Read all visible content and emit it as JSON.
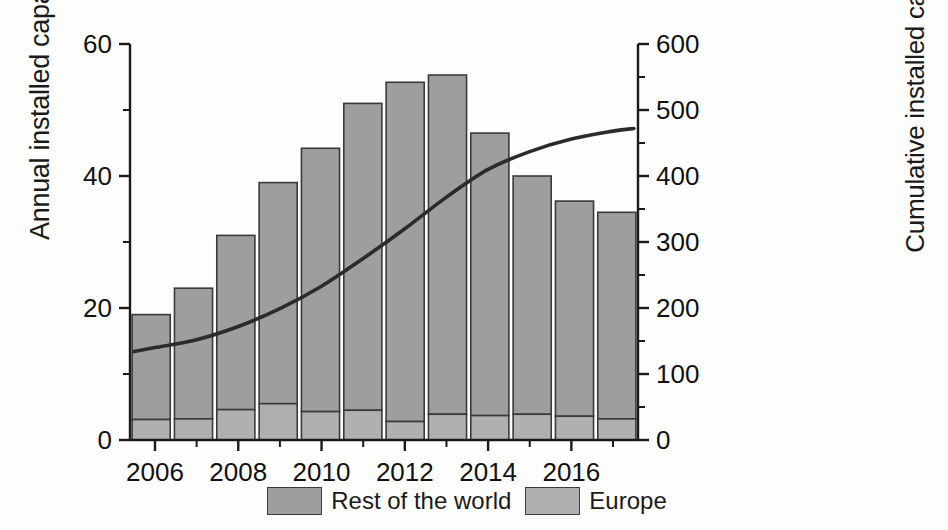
{
  "chart_data": {
    "type": "bar",
    "title": "",
    "subtitle": "",
    "categories": [
      2006,
      2007,
      2008,
      2009,
      2010,
      2011,
      2012,
      2013,
      2014,
      2015,
      2016,
      2017
    ],
    "xlabel": "",
    "xtick_labels": [
      "2006",
      "2008",
      "2010",
      "2012",
      "2014",
      "2016"
    ],
    "xtick_values": [
      2006,
      2008,
      2010,
      2012,
      2014,
      2016
    ],
    "xminor_values": [
      2007,
      2009,
      2011,
      2013,
      2015,
      2017
    ],
    "xlim": [
      2005.4,
      2017.6
    ],
    "grid": false,
    "legend_position": "bottom",
    "series": [
      {
        "name": "Europe",
        "axis": "left",
        "type": "bar",
        "stacked": true,
        "color": "#b0b0b0",
        "values": [
          3.1,
          3.2,
          4.6,
          5.5,
          4.3,
          4.5,
          2.8,
          3.9,
          3.7,
          3.9,
          3.6,
          3.2
        ]
      },
      {
        "name": "Rest of the world",
        "axis": "left",
        "type": "bar",
        "stacked": true,
        "color": "#9e9e9e",
        "values": [
          15.9,
          19.8,
          26.4,
          33.5,
          39.9,
          46.5,
          51.4,
          51.4,
          42.8,
          36.1,
          32.6,
          31.3
        ]
      },
      {
        "name": "Cumulative installed capacity",
        "axis": "right",
        "type": "line",
        "color": "#2b2b2b",
        "x": [
          2005.5,
          2006,
          2007,
          2008,
          2009,
          2010,
          2011,
          2012,
          2013,
          2014,
          2015,
          2016,
          2017,
          2017.5
        ],
        "values": [
          134,
          140,
          152,
          172,
          199,
          233,
          275,
          320,
          368,
          410,
          437,
          456,
          468,
          472
        ]
      }
    ],
    "bar_totals": [
      19.0,
      23.0,
      31.0,
      39.0,
      44.2,
      51.0,
      54.2,
      55.3,
      46.5,
      40.0,
      36.2,
      34.5
    ],
    "left_axis": {
      "label": "Annual installed capacity(GW)",
      "ylim": [
        0,
        60
      ],
      "ticks": [
        0,
        20,
        40,
        60
      ],
      "tick_labels": [
        "0",
        "20",
        "40",
        "60"
      ],
      "minor_ticks": [
        10,
        30,
        50
      ]
    },
    "right_axis": {
      "label": "Cumulative installed capacity (GW)",
      "ylim": [
        0,
        600
      ],
      "ticks": [
        0,
        100,
        200,
        300,
        400,
        500,
        600
      ],
      "tick_labels": [
        "0",
        "100",
        "200",
        "300",
        "400",
        "500",
        "600"
      ],
      "minor_ticks": [
        50,
        150,
        250,
        350,
        450,
        550
      ]
    },
    "legend": [
      {
        "label": "Rest of the world",
        "color": "#9e9e9e"
      },
      {
        "label": "Europe",
        "color": "#b0b0b0"
      }
    ],
    "colors": {
      "rest_of_world": "#9e9e9e",
      "europe": "#b0b0b0",
      "line": "#2b2b2b",
      "axis": "#1a1a1a",
      "background": "#fdfdfc"
    }
  }
}
